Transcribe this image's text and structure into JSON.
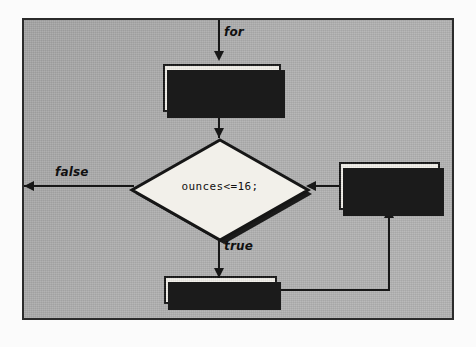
{
  "diagram": {
    "background_color": "#b1b1b1",
    "frame_color": "#2b2b2b",
    "node_fill_color": "#f2f0ea",
    "ink_color": "#161616"
  },
  "nodes": {
    "init": {
      "type": "process",
      "line1": "ounces=1,",
      "line2": "cost=FIRST;"
    },
    "condition": {
      "type": "decision",
      "text": "ounces<=16;"
    },
    "update": {
      "type": "process",
      "line1": "ounces++,",
      "line2": "cost+=NEXT;"
    },
    "body": {
      "type": "process",
      "text": "do this;"
    }
  },
  "edges": {
    "entry_label": "for",
    "false_label": "false",
    "true_label": "true"
  }
}
